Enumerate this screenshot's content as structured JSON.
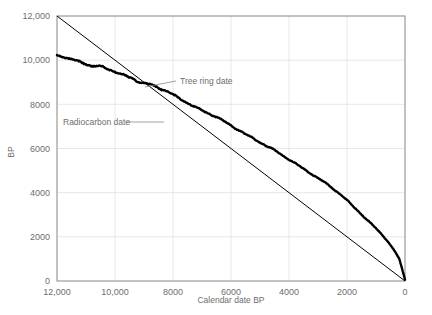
{
  "chart_data": {
    "type": "line",
    "title": "",
    "xlabel": "Calendar date BP",
    "ylabel": "BP",
    "xlim": [
      12000,
      0
    ],
    "ylim": [
      0,
      12000
    ],
    "x_reversed": true,
    "grid": true,
    "legend_position": "inline-annotations",
    "xticks": [
      12000,
      10000,
      8000,
      6000,
      4000,
      2000,
      0
    ],
    "xtick_labels": [
      "12,000",
      "10,000",
      "8000",
      "6000",
      "4000",
      "2000",
      "0"
    ],
    "yticks": [
      0,
      2000,
      4000,
      6000,
      8000,
      10000,
      12000
    ],
    "ytick_labels": [
      "0",
      "2000",
      "4000",
      "6000",
      "8000",
      "10,000",
      "12,000"
    ],
    "annotations": [
      {
        "name": "tree-ring-date",
        "text": "Tree ring date",
        "x": 7150,
        "y": 8900
      },
      {
        "name": "radiocarbon-date",
        "text": "Radiocarbon date",
        "x": 9700,
        "y": 7250
      }
    ],
    "series": [
      {
        "name": "Tree ring date",
        "style": "straight-line",
        "color": "#000000",
        "x": [
          12000,
          0
        ],
        "values": [
          12000,
          0
        ]
      },
      {
        "name": "Radiocarbon date",
        "style": "wiggly-calibration-curve",
        "color": "#000000",
        "x": [
          12000,
          11800,
          11600,
          11400,
          11200,
          11000,
          10800,
          10600,
          10400,
          10200,
          10000,
          9800,
          9600,
          9400,
          9200,
          9000,
          8800,
          8600,
          8400,
          8200,
          8000,
          7800,
          7600,
          7400,
          7200,
          7000,
          6800,
          6600,
          6400,
          6200,
          6000,
          5800,
          5600,
          5400,
          5200,
          5000,
          4800,
          4600,
          4400,
          4200,
          4000,
          3800,
          3600,
          3400,
          3200,
          3000,
          2800,
          2600,
          2400,
          2200,
          2000,
          1800,
          1600,
          1400,
          1200,
          1000,
          800,
          600,
          400,
          200,
          0
        ],
        "values": [
          10220,
          10170,
          10060,
          10010,
          9950,
          9870,
          9730,
          9700,
          9660,
          9560,
          9470,
          9350,
          9280,
          9200,
          9060,
          8960,
          8900,
          8800,
          8680,
          8560,
          8420,
          8280,
          8150,
          8020,
          7870,
          7730,
          7600,
          7480,
          7340,
          7180,
          7030,
          6890,
          6740,
          6590,
          6440,
          6290,
          6130,
          5980,
          5820,
          5660,
          5500,
          5340,
          5180,
          5010,
          4840,
          4660,
          4480,
          4290,
          4090,
          3880,
          3650,
          3400,
          3160,
          2900,
          2640,
          2380,
          2100,
          1800,
          1430,
          1000,
          60
        ]
      }
    ]
  }
}
